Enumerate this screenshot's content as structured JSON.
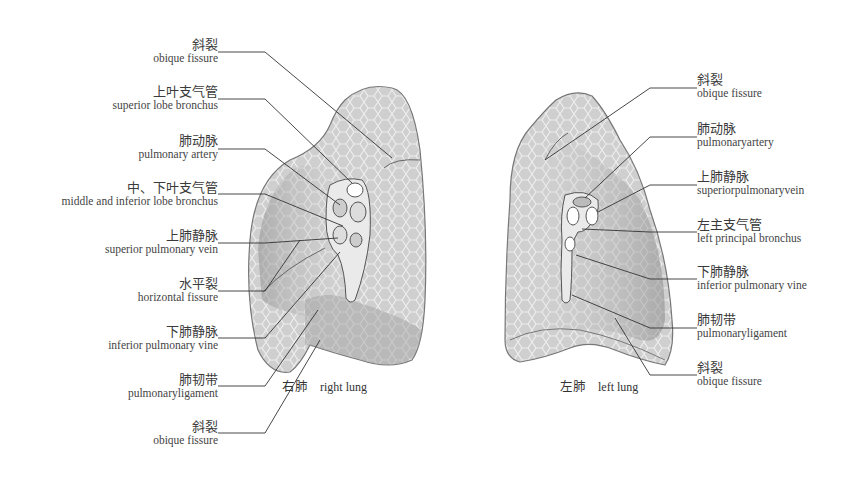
{
  "figure": {
    "right_lung": {
      "caption_zh": "右肺",
      "caption_en": "right lung",
      "labels": [
        {
          "zh": "斜裂",
          "en": "obique fissure"
        },
        {
          "zh": "上叶支气管",
          "en": "superior lobe bronchus"
        },
        {
          "zh": "肺动脉",
          "en": "pulmonary artery"
        },
        {
          "zh": "中、下叶支气管",
          "en": "middle and inferior lobe bronchus"
        },
        {
          "zh": "上肺静脉",
          "en": "superior pulmonary vein"
        },
        {
          "zh": "水平裂",
          "en": "horizontal fissure"
        },
        {
          "zh": "下肺静脉",
          "en": "inferior pulmonary vine"
        },
        {
          "zh": "肺韧带",
          "en": "pulmonaryligament"
        },
        {
          "zh": "斜裂",
          "en": "obique fissure"
        }
      ]
    },
    "left_lung": {
      "caption_zh": "左肺",
      "caption_en": "left lung",
      "labels": [
        {
          "zh": "斜裂",
          "en": "obique fissure"
        },
        {
          "zh": "肺动脉",
          "en": "pulmonaryartery"
        },
        {
          "zh": "上肺静脉",
          "en": "superiorpulmonaryvein"
        },
        {
          "zh": "左主支气管",
          "en": "left principal bronchus"
        },
        {
          "zh": "下肺静脉",
          "en": "inferior pulmonary vine"
        },
        {
          "zh": "肺韧带",
          "en": "pulmonaryligament"
        },
        {
          "zh": "斜裂",
          "en": "obique fissure"
        }
      ]
    },
    "colors": {
      "lung_light": "#d4d4d4",
      "lung_mid": "#a8a8a8",
      "lung_dark": "#8c8c8c",
      "leader_line": "#333333"
    }
  }
}
